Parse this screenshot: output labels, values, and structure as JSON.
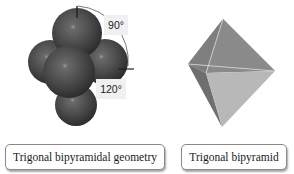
{
  "figure": {
    "left_model": {
      "name": "Trigonal bipyramidal geometry",
      "angles": {
        "axial_equatorial": "90°",
        "equatorial_equatorial": "120°"
      }
    },
    "right_model": {
      "name": "Trigonal bipyramid"
    }
  },
  "colors": {
    "sphere": "#4a4a4a",
    "sphere_highlight": "#9a9a9a",
    "polyhedron_light": "#b8b8b8",
    "polyhedron_dark": "#7a7a7a",
    "label_border": "#8a8a8a"
  }
}
